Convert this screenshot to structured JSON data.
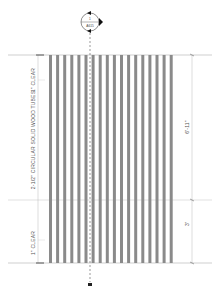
{
  "drawing": {
    "type": "architectural-elevation",
    "section_marker": {
      "number": "1",
      "sheet": "A615",
      "cx": 90,
      "cy": 22,
      "r": 10
    },
    "tubes": {
      "count": 18,
      "x_start": 49,
      "pitch": 7.1,
      "width": 3,
      "y_top": 55,
      "y_bottom": 263,
      "color": "#8a8a8a"
    },
    "lines": {
      "top_y": 55,
      "mid_y": 200,
      "bottom_y": 263,
      "section_x": 90,
      "left_dim_x": 38,
      "right_dim_x": 192
    },
    "labels": {
      "top_clear": "1\" CLEAR",
      "tubes_note": "2-1/2\" CIRCULAR SOLID WOOD TUBES",
      "bottom_clear": "1\" CLEAR",
      "dim_upper": "6'-11\"",
      "dim_lower": "3'"
    },
    "colors": {
      "line": "#9a9a9a",
      "tube": "#8a8a8a",
      "marker": "#222222",
      "text": "#555555"
    }
  }
}
